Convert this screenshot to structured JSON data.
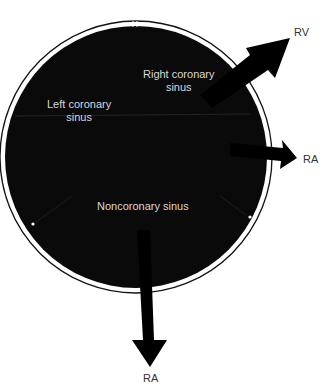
{
  "diagram": {
    "type": "aortic-valve-cross-section",
    "colors": {
      "fill": "#0a0a0a",
      "ring": "#111111",
      "background": "#ffffff",
      "inner_text": "#d8d8d8",
      "outer_text": "#333333"
    },
    "sinuses": {
      "right": {
        "line1": "Right coronary",
        "line2": "sinus"
      },
      "left": {
        "line1": "Left coronary",
        "line2": "sinus"
      },
      "non": {
        "line1": "Noncoronary sinus"
      }
    },
    "arrows": {
      "upper_right": {
        "label": "RV"
      },
      "right": {
        "label": "RA"
      },
      "bottom": {
        "label": "RA"
      }
    }
  }
}
